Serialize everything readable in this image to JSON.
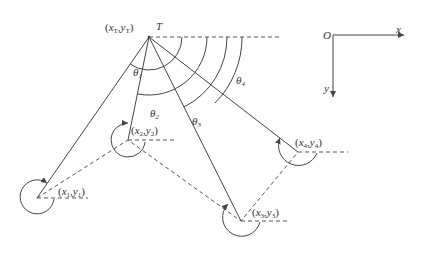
{
  "diagram": {
    "target": {
      "name": "T",
      "coord_x": "x",
      "coord_x_sub": "T",
      "coord_y": "y",
      "coord_y_sub": "T"
    },
    "angles": [
      {
        "sym": "θ",
        "sub": "1"
      },
      {
        "sym": "θ",
        "sub": "2"
      },
      {
        "sym": "θ",
        "sub": "3"
      },
      {
        "sym": "θ",
        "sub": "4"
      }
    ],
    "joints": [
      {
        "x": "x",
        "y": "y",
        "sub": "1"
      },
      {
        "x": "x",
        "y": "y",
        "sub": "2"
      },
      {
        "x": "x",
        "y": "y",
        "sub": "3"
      },
      {
        "x": "x",
        "y": "y",
        "sub": "4"
      }
    ],
    "axes": {
      "origin": "O",
      "x_label": "x",
      "y_label": "y"
    },
    "colors": {
      "line": "#444444",
      "background": "#ffffff"
    }
  }
}
